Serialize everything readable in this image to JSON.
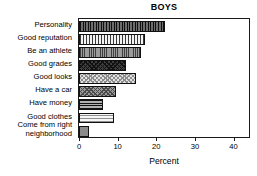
{
  "chart_data": {
    "type": "bar",
    "orientation": "horizontal",
    "title": "BOYS",
    "xlabel": "Percent",
    "ylabel": "",
    "xlim": [
      0,
      44
    ],
    "grid": false,
    "legend": null,
    "xticks": [
      0,
      10,
      20,
      30,
      40
    ],
    "xtick_labels": [
      "0",
      "10",
      "20",
      "30",
      "40"
    ],
    "categories": [
      "Personality",
      "Good reputation",
      "Be an athlete",
      "Good grades",
      "Good looks",
      "Have a car",
      "Have money",
      "Good clothes",
      "Come from right\nneighborhood"
    ],
    "values": [
      22.3,
      17.2,
      16.0,
      12.1,
      14.7,
      9.6,
      6.1,
      9.0,
      2.5
    ],
    "bar_fills": [
      "vertical-stripes-dark",
      "vertical-stripes-light",
      "vertical-lines-mid",
      "cross-hatch-dark",
      "cross-hatch-light",
      "cross-hatch-mid",
      "horizontal-stripes-dark",
      "horizontal-stripes-light",
      "solid-mid-gray"
    ]
  },
  "colors": {
    "axis": "#1a1a1a",
    "text": "#000000",
    "background": "#ffffff"
  }
}
